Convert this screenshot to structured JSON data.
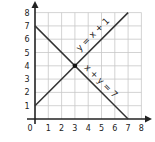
{
  "chart_data": {
    "type": "line",
    "title": "",
    "xlabel": "",
    "ylabel": "",
    "xlim": [
      0,
      8
    ],
    "ylim": [
      0,
      8
    ],
    "grid": true,
    "x_ticks": [
      "0",
      "1",
      "2",
      "3",
      "4",
      "5",
      "6",
      "7",
      "8"
    ],
    "y_ticks": [
      "1",
      "2",
      "3",
      "4",
      "5",
      "6",
      "7",
      "8"
    ],
    "series": [
      {
        "name": "y = x + 1",
        "x": [
          0,
          7
        ],
        "y": [
          1,
          8
        ]
      },
      {
        "name": "x + y = 7",
        "x": [
          0,
          7
        ],
        "y": [
          7,
          0
        ]
      }
    ],
    "annotations": [
      {
        "text": "y = x + 1",
        "at": [
          4.5,
          6.2
        ],
        "rotation": 45
      },
      {
        "text": "x + y = 7",
        "at": [
          4.8,
          2.7
        ],
        "rotation": -45
      },
      {
        "type": "point",
        "at": [
          3,
          4
        ],
        "label": "intersection"
      }
    ],
    "colors": {
      "line": "#333333",
      "grid": "#c8c8c8",
      "axis": "#222222"
    }
  }
}
